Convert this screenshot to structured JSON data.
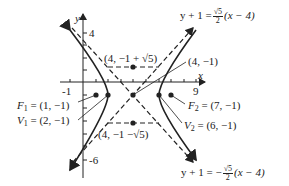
{
  "diagram": {
    "type": "hyperbola-graph",
    "axes": {
      "x_label": "x",
      "y_label": "y",
      "tick_labels": {
        "x": [
          "-1",
          "9"
        ],
        "y": [
          "4",
          "-6"
        ]
      }
    },
    "labels": {
      "top_box": "(4, −1 + √5)",
      "center": "(4, −1)",
      "bottom_box": "(4, −1 −√5)",
      "f1": {
        "name": "F",
        "sub": "1",
        "value": "= (1, −1)"
      },
      "v1": {
        "name": "V",
        "sub": "1",
        "value": "= (2, −1)"
      },
      "f2": {
        "name": "F",
        "sub": "2",
        "value": "= (7, −1)"
      },
      "v2": {
        "name": "V",
        "sub": "2",
        "value": "= (6, −1)"
      },
      "asymptote_pos": {
        "lhs": "y + 1 =",
        "num": "√5",
        "den": "2",
        "rhs": "(x − 4)"
      },
      "asymptote_neg": {
        "lhs": "y + 1 = −",
        "num": "√5",
        "den": "2",
        "rhs": "(x −  4)"
      }
    },
    "colors": {
      "ink": "#222222",
      "background": "#ffffff"
    }
  }
}
